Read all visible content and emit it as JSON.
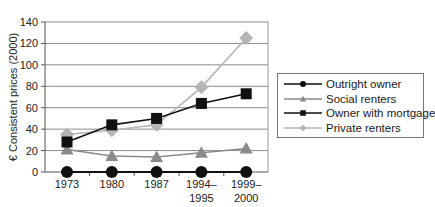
{
  "chart_data": {
    "type": "line",
    "title": "",
    "xlabel": "",
    "ylabel": "€ Consistent prices (2000)",
    "ylim": [
      0,
      140
    ],
    "yticks": [
      0,
      20,
      40,
      60,
      80,
      100,
      120,
      140
    ],
    "grid": true,
    "legend_position": "right",
    "categories": [
      "1973",
      "1980",
      "1987",
      "1994–1995",
      "1999–2000"
    ],
    "category_lines": [
      [
        "1973"
      ],
      [
        "1980"
      ],
      [
        "1987"
      ],
      [
        "1994–",
        "1995"
      ],
      [
        "1999–",
        "2000"
      ]
    ],
    "series": [
      {
        "name": "Outright owner",
        "values": [
          0,
          0,
          0,
          0,
          0
        ],
        "color": "#111111",
        "marker": "circle"
      },
      {
        "name": "Social renters",
        "values": [
          21,
          15,
          14,
          18,
          22
        ],
        "color": "#8a8a8a",
        "marker": "triangle"
      },
      {
        "name": "Owner with mortgage",
        "values": [
          28,
          44,
          50,
          64,
          73
        ],
        "color": "#111111",
        "marker": "square"
      },
      {
        "name": "Private renters",
        "values": [
          35,
          39,
          44,
          79,
          125
        ],
        "color": "#b5b5b5",
        "marker": "diamond"
      }
    ]
  },
  "colors": {
    "grid": "#8c8c8c",
    "axis": "#555555",
    "frame": "#9a9a9a"
  }
}
